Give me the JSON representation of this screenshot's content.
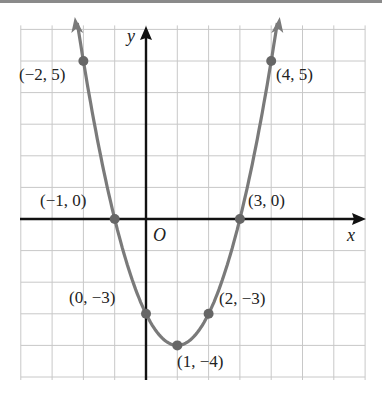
{
  "chart_data": {
    "type": "line",
    "title": "",
    "xlabel": "x",
    "ylabel": "y",
    "origin_label": "O",
    "xlim": [
      -4,
      7
    ],
    "ylim": [
      -5,
      6
    ],
    "grid": true,
    "function": "y = x^2 - 2x - 3",
    "series": [
      {
        "name": "parabola",
        "color": "#7a7a7a",
        "x": [
          -2,
          -1,
          0,
          1,
          2,
          3,
          4
        ],
        "values": [
          5,
          0,
          -3,
          -4,
          -3,
          0,
          5
        ]
      }
    ],
    "points": [
      {
        "x": -2,
        "y": 5,
        "label": "(−2, 5)"
      },
      {
        "x": -1,
        "y": 0,
        "label": "(−1, 0)"
      },
      {
        "x": 0,
        "y": -3,
        "label": "(0, −3)"
      },
      {
        "x": 1,
        "y": -4,
        "label": "(1, −4)"
      },
      {
        "x": 2,
        "y": -3,
        "label": "(2, −3)"
      },
      {
        "x": 3,
        "y": 0,
        "label": "(3, 0)"
      },
      {
        "x": 4,
        "y": 5,
        "label": "(4, 5)"
      }
    ],
    "annotations": [
      "(−2, 5)",
      "(4, 5)",
      "(−1, 0)",
      "(3, 0)",
      "(0, −3)",
      "(2, −3)",
      "(1, −4)"
    ]
  },
  "labels": {
    "x_axis": "x",
    "y_axis": "y",
    "origin": "O",
    "p_m2_5": "(−2, 5)",
    "p_4_5": "(4, 5)",
    "p_m1_0": "(−1, 0)",
    "p_3_0": "(3, 0)",
    "p_0_m3": "(0, −3)",
    "p_2_m3": "(2, −3)",
    "p_1_m4": "(1, −4)"
  },
  "colors": {
    "curve": "#7a7a7a",
    "axes": "#111111",
    "grid": "#c8c8c8",
    "rule": "#8a8a8a"
  }
}
